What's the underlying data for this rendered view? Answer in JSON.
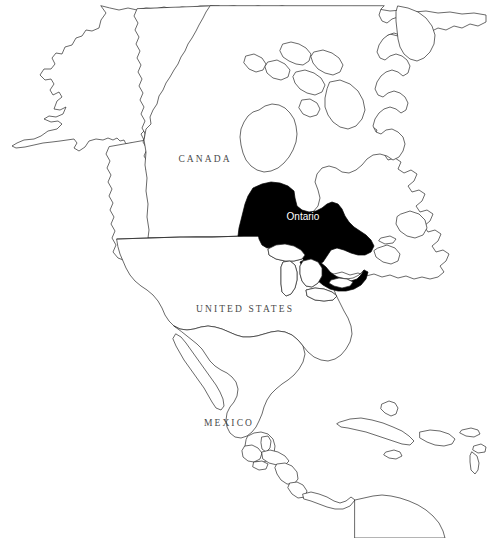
{
  "figure": {
    "type": "locator-map",
    "background_color": "#ffffff",
    "outline_color": "#2a2a2a",
    "highlight_color": "#000000",
    "label_color": "#4a4a4a",
    "highlight_label_color": "#ffffff",
    "width": 488,
    "height": 551
  },
  "labels": {
    "canada": "CANADA",
    "united_states": "UNITED STATES",
    "mexico": "MEXICO",
    "ontario": "Ontario"
  },
  "highlighted_region": {
    "name": "Ontario",
    "country": "CANADA",
    "fill": "#000000"
  },
  "caption": {
    "visible": "partially-cropped",
    "text": ""
  }
}
